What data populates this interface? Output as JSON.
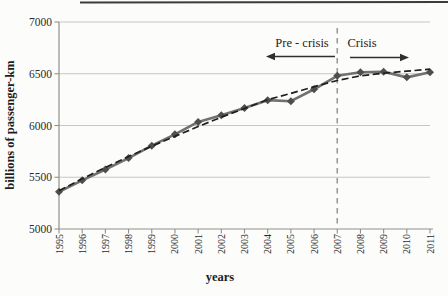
{
  "chart_data": {
    "type": "line",
    "title": "",
    "xlabel": "years",
    "ylabel": "billions of passenger-km",
    "x": [
      1995,
      1996,
      1997,
      1998,
      1999,
      2000,
      2001,
      2002,
      2003,
      2004,
      2005,
      2006,
      2007,
      2008,
      2009,
      2010,
      2011
    ],
    "ylim": [
      5000,
      7000
    ],
    "yticks": [
      5000,
      5500,
      6000,
      6500,
      7000
    ],
    "grid": "horizontal-light",
    "legend": "none",
    "series": [
      {
        "name": "passenger traffic (observed)",
        "line": "solid",
        "marker": "diamond",
        "color": "#717171",
        "marker_color": "#4e4e4e",
        "values": [
          5360,
          5470,
          5575,
          5685,
          5805,
          5915,
          6035,
          6100,
          6170,
          6245,
          6235,
          6350,
          6480,
          6515,
          6520,
          6465,
          6515
        ]
      },
      {
        "name": "trend",
        "line": "dashed",
        "marker": "none",
        "color": "#1f1f1f",
        "values": [
          5370,
          5485,
          5595,
          5700,
          5800,
          5895,
          5990,
          6080,
          6165,
          6250,
          6310,
          6375,
          6435,
          6480,
          6505,
          6525,
          6545
        ]
      }
    ],
    "annotations": {
      "pre_crisis_label": "Pre - crisis",
      "crisis_label": "Crisis",
      "divider_year": 2007,
      "divider_style": "vertical-dashed-gray"
    }
  },
  "colors": {
    "background": "#fcfcfa",
    "grid": "#c6c6c4",
    "axis": "#8f8f8d",
    "text": "#2b2b2b",
    "divider": "#9a9a9a",
    "top_border": "#3c3c3c",
    "arrow": "#2f2f2f"
  }
}
